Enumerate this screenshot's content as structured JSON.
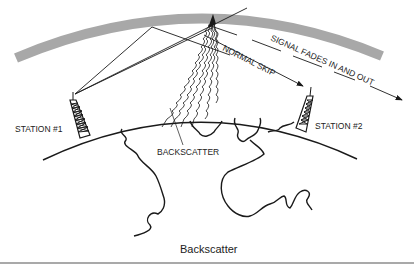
{
  "figure": {
    "title": "Backscatter",
    "labels": {
      "station1": "STATION #1",
      "station2": "STATION #2",
      "backscatter": "BACKSCATTER",
      "normal_skip": "NORMAL SKIP",
      "signal_fades": "SIGNAL FADES IN AND OUT"
    },
    "colors": {
      "ionosphere": "#a8a8a8",
      "ink": "#1a1a1a",
      "rule": "#555555"
    }
  }
}
